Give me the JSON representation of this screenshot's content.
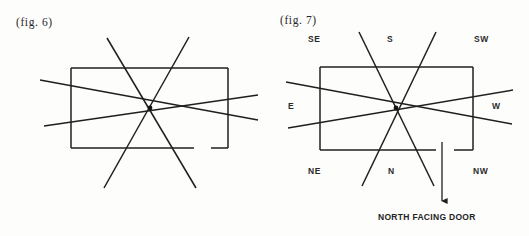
{
  "document": {
    "title": "Vastu orientation figures",
    "background_color": "#fdfdfc",
    "ink_color": "#1a1a1a"
  },
  "figures": [
    {
      "id": "fig6",
      "label": "(fig. 6)",
      "has_compass_labels": false,
      "has_arrow": false,
      "rect": {
        "x": 71,
        "y": 68,
        "width": 157,
        "height": 80
      },
      "rect_bottom_gap": {
        "from_x": 194,
        "to_x": 211
      },
      "center": {
        "x": 150,
        "y": 108
      },
      "rays": [
        {
          "name": "ray-se-top-left",
          "x1": 107,
          "y1": 38,
          "x2": 196,
          "y2": 188
        },
        {
          "name": "ray-sw-top-right",
          "x1": 189,
          "y1": 37,
          "x2": 104,
          "y2": 188
        },
        {
          "name": "ray-e-shallow",
          "x1": 40,
          "y1": 80,
          "x2": 258,
          "y2": 120
        },
        {
          "name": "ray-w-shallow",
          "x1": 44,
          "y1": 126,
          "x2": 258,
          "y2": 95
        }
      ]
    },
    {
      "id": "fig7",
      "label": "(fig. 7)",
      "has_compass_labels": true,
      "has_arrow": true,
      "rect": {
        "x": 56,
        "y": 67,
        "width": 153,
        "height": 83
      },
      "rect_bottom_gap": {
        "from_x": 172,
        "to_x": 190
      },
      "center": {
        "x": 132,
        "y": 108
      },
      "rays": [
        {
          "name": "ray-se-top-left",
          "x1": 95,
          "y1": 32,
          "x2": 170,
          "y2": 186
        },
        {
          "name": "ray-sw-top-right",
          "x1": 172,
          "y1": 32,
          "x2": 98,
          "y2": 186
        },
        {
          "name": "ray-e-shallow",
          "x1": 22,
          "y1": 82,
          "x2": 248,
          "y2": 124
        },
        {
          "name": "ray-w-shallow",
          "x1": 24,
          "y1": 128,
          "x2": 249,
          "y2": 90
        }
      ],
      "arrow": {
        "x": 178,
        "y_start": 142,
        "y_end": 208
      },
      "compass": {
        "se": "SE",
        "s": "S",
        "sw": "SW",
        "e": "E",
        "w": "W",
        "ne": "NE",
        "n": "N",
        "nw": "NW"
      },
      "caption": "NORTH FACING DOOR"
    }
  ]
}
